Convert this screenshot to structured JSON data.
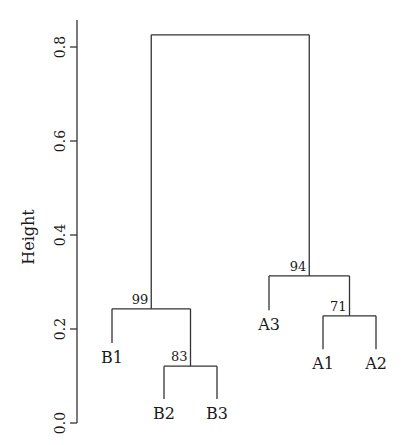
{
  "chart_data": {
    "type": "dendrogram",
    "title": "",
    "xlabel": "",
    "ylabel": "Height",
    "ylim": [
      0.0,
      0.85
    ],
    "yticks": [
      0.0,
      0.2,
      0.4,
      0.6,
      0.8
    ],
    "ytick_labels": [
      "0.0",
      "0.2",
      "0.4",
      "0.6",
      "0.8"
    ],
    "grid": false,
    "leaves": [
      {
        "label": "B1",
        "x": 112,
        "end": 0.17
      },
      {
        "label": "B2",
        "x": 164,
        "end": 0.051
      },
      {
        "label": "B3",
        "x": 217,
        "end": 0.051
      },
      {
        "label": "A3",
        "x": 269,
        "end": 0.24
      },
      {
        "label": "A1",
        "x": 323,
        "end": 0.157
      },
      {
        "label": "A2",
        "x": 376,
        "end": 0.157
      }
    ],
    "merges": [
      {
        "id": "m1",
        "children": [
          "B2",
          "B3"
        ],
        "height": 0.121,
        "support": "83"
      },
      {
        "id": "m2",
        "children": [
          "B1",
          "m1"
        ],
        "height": 0.243,
        "support": "99"
      },
      {
        "id": "m3",
        "children": [
          "A1",
          "A2"
        ],
        "height": 0.228,
        "support": "71"
      },
      {
        "id": "m4",
        "children": [
          "A3",
          "m3"
        ],
        "height": 0.313,
        "support": "94"
      },
      {
        "id": "root",
        "children": [
          "m2",
          "m4"
        ],
        "height": 0.826,
        "support": ""
      }
    ]
  },
  "layout": {
    "axis_x": 77,
    "y0_px": 423,
    "px_per_unit": 470,
    "axis_top_px": 20
  }
}
